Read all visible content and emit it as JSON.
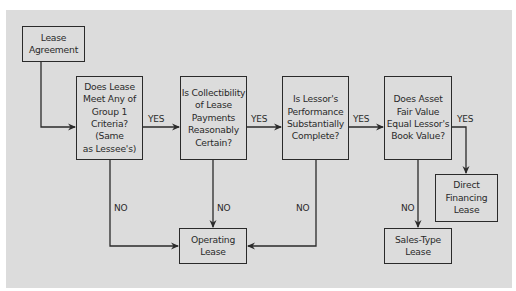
{
  "diagram": {
    "nodes": {
      "start": {
        "text": "Lease\nAgreement"
      },
      "q1": {
        "text": "Does Lease\nMeet Any of\nGroup 1\nCriteria? (Same\nas Lessee's)"
      },
      "q2": {
        "text": "Is Collectibility\nof Lease\nPayments\nReasonably\nCertain?"
      },
      "q3": {
        "text": "Is Lessor's\nPerformance\nSubstantially\nComplete?"
      },
      "q4": {
        "text": "Does Asset\nFair Value\nEqual Lessor's\nBook Value?"
      },
      "operating": {
        "text": "Operating\nLease"
      },
      "sales_type": {
        "text": "Sales-Type\nLease"
      },
      "direct_financing": {
        "text": "Direct\nFinancing\nLease"
      }
    },
    "edge_labels": {
      "q1_q2": "YES",
      "q2_q3": "YES",
      "q3_q4": "YES",
      "q4_direct": "YES",
      "q1_operating": "NO",
      "q2_operating": "NO",
      "q3_operating": "NO",
      "q4_sales": "NO"
    },
    "edges": [
      {
        "from": "start",
        "to": "q1"
      },
      {
        "from": "q1",
        "to": "q2",
        "label": "YES"
      },
      {
        "from": "q2",
        "to": "q3",
        "label": "YES"
      },
      {
        "from": "q3",
        "to": "q4",
        "label": "YES"
      },
      {
        "from": "q4",
        "to": "direct_financing",
        "label": "YES"
      },
      {
        "from": "q1",
        "to": "operating",
        "label": "NO"
      },
      {
        "from": "q2",
        "to": "operating",
        "label": "NO"
      },
      {
        "from": "q3",
        "to": "operating",
        "label": "NO"
      },
      {
        "from": "q4",
        "to": "sales_type",
        "label": "NO"
      }
    ],
    "colors": {
      "background": "#dcdcdc",
      "stroke": "#2a2a2a"
    }
  }
}
